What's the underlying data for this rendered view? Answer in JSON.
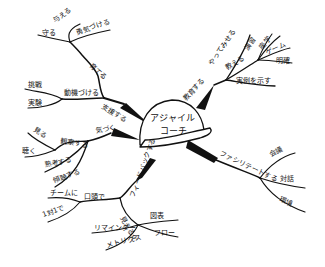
{
  "center": {
    "line1": "アジャイル",
    "line2": "コーチ"
  },
  "colors": {
    "ink": "#111111",
    "background": "#ffffff"
  },
  "branches": {
    "support": {
      "label": "支援する",
      "children": {
        "motivate": {
          "label": "動機づける",
          "children": [
            "挑戦",
            "実験"
          ]
        },
        "nurture": {
          "label": "育てる",
          "children": [
            "守る",
            "与える",
            "勇気づける"
          ]
        }
      }
    },
    "educate": {
      "label": "教育する",
      "children": {
        "demonstrate": {
          "label": "やってみせる"
        },
        "teach": {
          "label": "教える",
          "children": [
            "演習",
            "座学",
            "ゲーム",
            "明確"
          ]
        },
        "example": {
          "label": "実例を示す"
        }
      }
    },
    "notice": {
      "label": "気づく",
      "children": {
        "observe": {
          "label": "観察する",
          "children": [
            "見る",
            "聴く"
          ]
        },
        "others": [
          "熟考する",
          "傾聴する"
        ]
      }
    },
    "facilitate": {
      "label": "ファシリテートする",
      "children": [
        "会議",
        "対話",
        "環境"
      ]
    },
    "feedback": {
      "label": "フィードバックする",
      "children": {
        "verbal": {
          "label": "口頭で",
          "children": [
            "チームに",
            "1対1で"
          ]
        },
        "visualize": {
          "label": "見える化",
          "children": [
            "図表",
            "フロー",
            "リマインダー",
            "メトリクス"
          ]
        }
      }
    }
  }
}
